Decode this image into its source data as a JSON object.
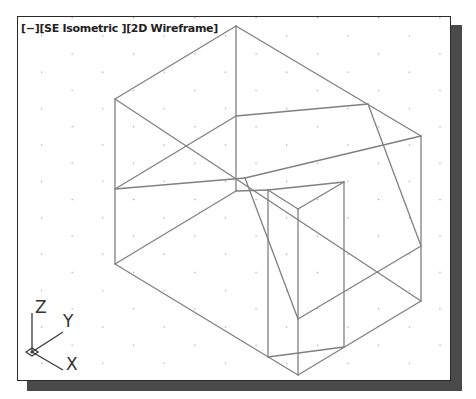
{
  "viewport": {
    "controls": {
      "menu": "[−]",
      "view": "[SE Isometric ]",
      "visual_style": "[2D Wireframe]"
    },
    "view_name": "SE Isometric",
    "visual_style_name": "2D Wireframe",
    "background_color": "#ffffff",
    "line_color": "#808080",
    "grid": {
      "visible": true,
      "dot_color": "#9a9a9a"
    }
  },
  "ucs_icon": {
    "z_label": "Z",
    "y_label": "Y",
    "x_label": "X"
  },
  "model": {
    "type": "wireframe",
    "edges": [
      [
        [
          235,
          25
        ],
        [
          114,
          98
        ]
      ],
      [
        [
          235,
          25
        ],
        [
          420,
          135
        ]
      ],
      [
        [
          235,
          25
        ],
        [
          235,
          115
        ]
      ],
      [
        [
          114,
          98
        ],
        [
          114,
          263
        ]
      ],
      [
        [
          420,
          135
        ],
        [
          420,
          300
        ]
      ],
      [
        [
          114,
          98
        ],
        [
          420,
          300
        ]
      ],
      [
        [
          114,
          188
        ],
        [
          235,
          115
        ]
      ],
      [
        [
          235,
          115
        ],
        [
          367,
          103
        ]
      ],
      [
        [
          114,
          188
        ],
        [
          244,
          177
        ]
      ],
      [
        [
          244,
          177
        ],
        [
          420,
          135
        ]
      ],
      [
        [
          235,
          115
        ],
        [
          235,
          190
        ]
      ],
      [
        [
          114,
          263
        ],
        [
          235,
          190
        ]
      ],
      [
        [
          235,
          190
        ],
        [
          267,
          189
        ]
      ],
      [
        [
          367,
          103
        ],
        [
          420,
          245
        ]
      ],
      [
        [
          244,
          177
        ],
        [
          297,
          318
        ]
      ],
      [
        [
          297,
          318
        ],
        [
          420,
          245
        ]
      ],
      [
        [
          114,
          263
        ],
        [
          297,
          374
        ]
      ],
      [
        [
          297,
          374
        ],
        [
          420,
          300
        ]
      ],
      [
        [
          267,
          189
        ],
        [
          297,
          208
        ]
      ],
      [
        [
          297,
          208
        ],
        [
          343,
          181
        ]
      ],
      [
        [
          267,
          189
        ],
        [
          343,
          181
        ]
      ],
      [
        [
          267,
          189
        ],
        [
          267,
          356
        ]
      ],
      [
        [
          297,
          208
        ],
        [
          297,
          374
        ]
      ],
      [
        [
          343,
          181
        ],
        [
          343,
          346
        ]
      ],
      [
        [
          267,
          356
        ],
        [
          343,
          346
        ]
      ]
    ]
  }
}
